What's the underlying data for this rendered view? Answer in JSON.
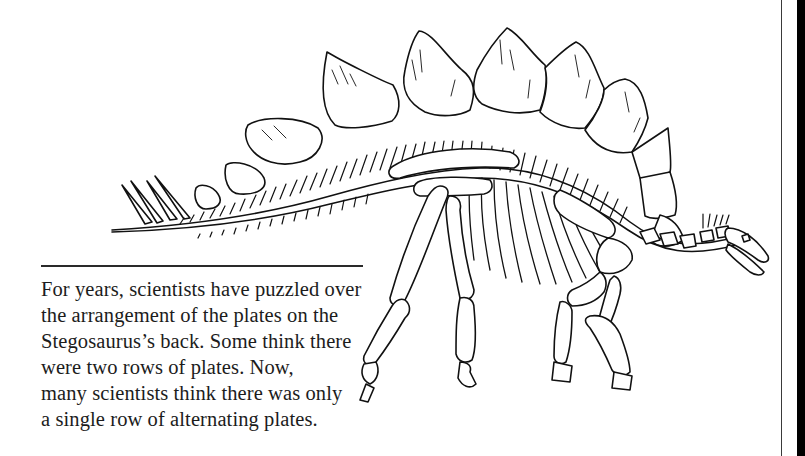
{
  "illustration": {
    "subject": "Stegosaurus skeleton",
    "style": "black line art on white",
    "stroke_color": "#111111",
    "fill_color": "#ffffff"
  },
  "caption": {
    "lines": [
      "For years, scientists have puzzled over",
      "the arrangement of the plates on the",
      "Stegosaurus’s back. Some think there",
      "were two rows of plates. Now,",
      "many scientists think there was only",
      "a single row of alternating plates."
    ]
  },
  "colors": {
    "background": "#ffffff",
    "text": "#1c1c1c",
    "rule": "#2a2a2a",
    "edge_bar": "#000000"
  }
}
